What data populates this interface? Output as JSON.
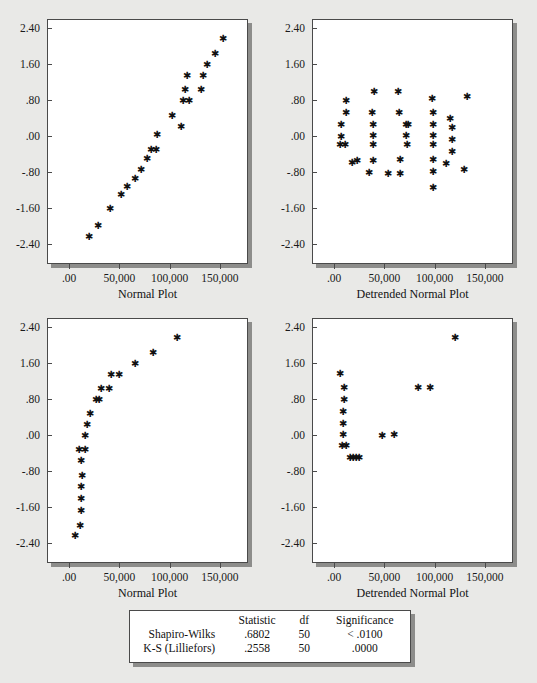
{
  "page": {
    "background_color": "#e9e9e7",
    "panel_background": "#ffffff",
    "frame_color": "#4a4a4a",
    "shadow_color": "#8d8d8b",
    "marker_glyph": "✱"
  },
  "axes": {
    "y_ticks": [
      "2.40",
      "1.60",
      ".80",
      ".00",
      "-.80",
      "-1.60",
      "-2.40"
    ],
    "y_values": [
      2.4,
      1.6,
      0.8,
      0.0,
      -0.8,
      -1.6,
      -2.4
    ],
    "y_range": [
      -2.85,
      2.6
    ],
    "x_ticks": [
      ".00",
      "50,000",
      "100,000",
      "150,000"
    ],
    "x_values": [
      0,
      50000,
      100000,
      150000
    ],
    "x_range": [
      -22000,
      178000
    ]
  },
  "chart_data": [
    {
      "id": "normal-plot-top",
      "type": "scatter",
      "title": "",
      "xlabel": "Normal Plot",
      "ylabel": "",
      "xlim": [
        -22000,
        178000
      ],
      "ylim": [
        -2.85,
        2.6
      ],
      "grid": false,
      "legend": "none",
      "marker": "asterisk",
      "points": [
        [
          18000,
          -2.22
        ],
        [
          27000,
          -1.98
        ],
        [
          39000,
          -1.6
        ],
        [
          50000,
          -1.28
        ],
        [
          56000,
          -1.11
        ],
        [
          64000,
          -0.92
        ],
        [
          70000,
          -0.72
        ],
        [
          76000,
          -0.49
        ],
        [
          80000,
          -0.28
        ],
        [
          85000,
          -0.28
        ],
        [
          86000,
          0.06
        ],
        [
          101000,
          0.47
        ],
        [
          110000,
          0.24
        ],
        [
          112000,
          0.8
        ],
        [
          118000,
          0.8
        ],
        [
          114000,
          1.06
        ],
        [
          116000,
          1.37
        ],
        [
          130000,
          1.06
        ],
        [
          132000,
          1.37
        ],
        [
          136000,
          1.61
        ],
        [
          144000,
          1.86
        ],
        [
          152000,
          2.18
        ]
      ]
    },
    {
      "id": "detrended-normal-plot-top",
      "type": "scatter",
      "title": "",
      "xlabel": "Detrended Normal Plot",
      "ylabel": "",
      "xlim": [
        -22000,
        178000
      ],
      "ylim": [
        -2.85,
        2.6
      ],
      "grid": false,
      "legend": "none",
      "marker": "asterisk",
      "points": [
        [
          5000,
          0.28
        ],
        [
          5000,
          0.0
        ],
        [
          4000,
          -0.18
        ],
        [
          9000,
          -0.18
        ],
        [
          10000,
          0.8
        ],
        [
          10000,
          0.55
        ],
        [
          16000,
          -0.56
        ],
        [
          21000,
          -0.53
        ],
        [
          36000,
          0.55
        ],
        [
          37000,
          0.28
        ],
        [
          37000,
          0.03
        ],
        [
          37000,
          -0.18
        ],
        [
          37000,
          -0.52
        ],
        [
          38000,
          1.0
        ],
        [
          33000,
          -0.8
        ],
        [
          52000,
          -0.81
        ],
        [
          62000,
          1.0
        ],
        [
          63000,
          0.55
        ],
        [
          64000,
          -0.5
        ],
        [
          64000,
          -0.81
        ],
        [
          70000,
          0.28
        ],
        [
          70000,
          0.02
        ],
        [
          71000,
          -0.18
        ],
        [
          72000,
          0.28
        ],
        [
          96000,
          0.86
        ],
        [
          97000,
          0.55
        ],
        [
          97000,
          0.28
        ],
        [
          97000,
          0.03
        ],
        [
          97000,
          -0.18
        ],
        [
          97000,
          -0.5
        ],
        [
          97000,
          -0.78
        ],
        [
          97000,
          -1.13
        ],
        [
          114000,
          0.4
        ],
        [
          116000,
          0.2
        ],
        [
          116000,
          -0.05
        ],
        [
          116000,
          -0.32
        ],
        [
          110000,
          -0.6
        ],
        [
          128000,
          -0.72
        ],
        [
          131000,
          0.9
        ]
      ]
    },
    {
      "id": "normal-plot-bottom",
      "type": "scatter",
      "title": "",
      "xlabel": "Normal Plot",
      "ylabel": "",
      "xlim": [
        -22000,
        178000
      ],
      "ylim": [
        -2.85,
        2.6
      ],
      "grid": false,
      "legend": "none",
      "marker": "asterisk",
      "points": [
        [
          4000,
          -2.22
        ],
        [
          9000,
          -2.0
        ],
        [
          10000,
          -1.65
        ],
        [
          10000,
          -1.4
        ],
        [
          10000,
          -1.12
        ],
        [
          11000,
          -0.88
        ],
        [
          10000,
          -0.55
        ],
        [
          8000,
          -0.3
        ],
        [
          14000,
          -0.3
        ],
        [
          14000,
          0.0
        ],
        [
          16000,
          0.26
        ],
        [
          19000,
          0.5
        ],
        [
          25000,
          0.8
        ],
        [
          28000,
          0.8
        ],
        [
          30000,
          1.06
        ],
        [
          38000,
          1.06
        ],
        [
          40000,
          1.36
        ],
        [
          48000,
          1.36
        ],
        [
          64000,
          1.6
        ],
        [
          82000,
          1.86
        ],
        [
          106000,
          2.18
        ]
      ]
    },
    {
      "id": "detrended-normal-plot-bottom",
      "type": "scatter",
      "title": "",
      "xlabel": "Detrended Normal Plot",
      "ylabel": "",
      "xlim": [
        -22000,
        178000
      ],
      "ylim": [
        -2.85,
        2.6
      ],
      "grid": false,
      "legend": "none",
      "marker": "asterisk",
      "points": [
        [
          4000,
          1.38
        ],
        [
          8000,
          1.08
        ],
        [
          8000,
          0.82
        ],
        [
          7000,
          0.55
        ],
        [
          7000,
          0.28
        ],
        [
          7000,
          0.02
        ],
        [
          6000,
          -0.22
        ],
        [
          10000,
          -0.22
        ],
        [
          14000,
          -0.48
        ],
        [
          17000,
          -0.48
        ],
        [
          20000,
          -0.48
        ],
        [
          23000,
          -0.48
        ],
        [
          46000,
          0.0
        ],
        [
          58000,
          0.02
        ],
        [
          82000,
          1.08
        ],
        [
          94000,
          1.08
        ],
        [
          119000,
          2.18
        ]
      ]
    }
  ],
  "stats_table": {
    "columns": [
      "",
      "Statistic",
      "df",
      "Significance"
    ],
    "rows": [
      {
        "name": "Shapiro-Wilks",
        "statistic": ".6802",
        "df": "50",
        "significance": "< .0100"
      },
      {
        "name": "K-S (Lilliefors)",
        "statistic": ".2558",
        "df": "50",
        "significance": ".0000"
      }
    ]
  }
}
